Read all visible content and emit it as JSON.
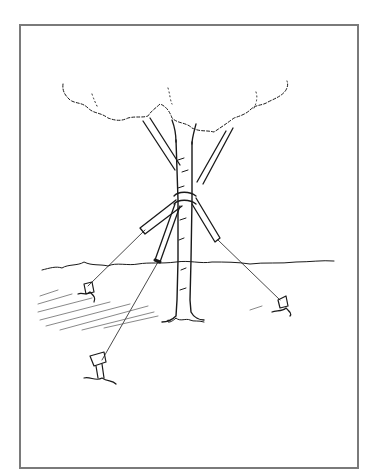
{
  "illustration": {
    "subject": "staked tree with guy wires",
    "frame_color": "#7a7a7a",
    "ink_color": "#1a1a1a",
    "elements": [
      "tree-canopy",
      "tree-trunk",
      "branches",
      "support-collar",
      "guy-wires",
      "ground-stakes",
      "ground-line",
      "shadow-hatching"
    ]
  }
}
